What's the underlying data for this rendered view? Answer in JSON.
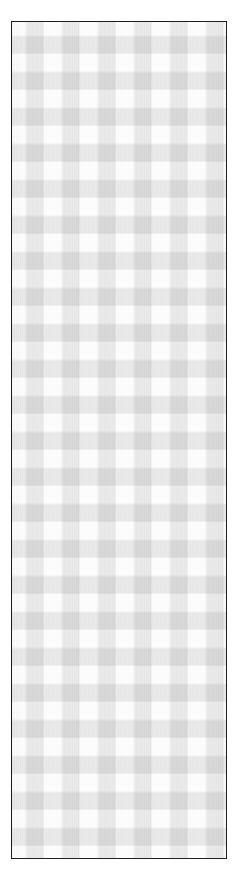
{
  "image": {
    "subject": "Gingham checkered fabric swatch",
    "description": "A tall narrow rectangular swatch of grey and white gingham check fabric outlined by a thin dark border on a plain white background.",
    "orientation": "portrait",
    "background_color": "#ffffff"
  },
  "swatch": {
    "label": "gingham fabric swatch",
    "border_color": "#1e1e20",
    "border_width_px": 2,
    "x": 11,
    "y": 21,
    "width": 216,
    "height": 838
  },
  "pattern": {
    "name": "gingham check",
    "type": "two-axis translucent stripe weave",
    "check_period_px": 36,
    "stripe_width_px": 18,
    "columns": 6,
    "rows": 23,
    "tones": {
      "light": "#ffffff",
      "mid": "#e9e9e9",
      "dark": "#c5c5c5"
    },
    "first_cell_tone": "light",
    "stripe_alpha": 0.09,
    "stripe_color": "#232326"
  }
}
